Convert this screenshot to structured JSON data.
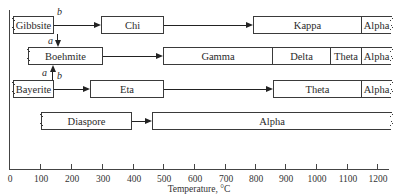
{
  "diagram": {
    "x_axis": {
      "label": "Temperature, °C",
      "ticks": [
        "0",
        "100",
        "200",
        "300",
        "400",
        "500",
        "600",
        "700",
        "800",
        "900",
        "1000",
        "1100",
        "1200"
      ]
    },
    "rows": [
      {
        "start": "Gibbsite",
        "phases": [
          "Chi",
          "Kappa",
          "Alpha"
        ]
      },
      {
        "start": "Boehmite",
        "phases": [
          "Gamma",
          "Delta",
          "Theta",
          "Alpha"
        ]
      },
      {
        "start": "Bayerite",
        "phases": [
          "Eta",
          "Theta",
          "Alpha"
        ]
      },
      {
        "start": "Diaspore",
        "phases": [
          "Alpha"
        ]
      }
    ],
    "path_labels": {
      "gibbsite_b": "b",
      "gibbsite_a": "a",
      "bayerite_a": "a",
      "bayerite_b": "b"
    }
  }
}
